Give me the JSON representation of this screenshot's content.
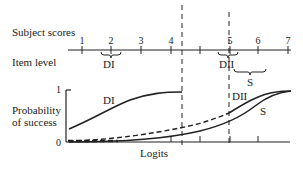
{
  "labels": {
    "subject_scores": "Subject scores",
    "item_level": "Item level",
    "probability_line1": "Probability",
    "probability_line2": "of success",
    "x_axis": "Logits",
    "y_top": "1",
    "y_bottom": "0"
  },
  "scale": {
    "ticks": [
      "1",
      "2",
      "3",
      "4",
      "",
      "5",
      "6",
      "7"
    ]
  },
  "items": [
    {
      "name": "DI",
      "center": 2
    },
    {
      "name": "DII",
      "center": 5
    },
    {
      "name": "S",
      "center": 5.75
    }
  ],
  "curves": [
    {
      "name": "DI",
      "label": "DI"
    },
    {
      "name": "DII",
      "label": "DII"
    },
    {
      "name": "S",
      "label": "S"
    }
  ]
}
